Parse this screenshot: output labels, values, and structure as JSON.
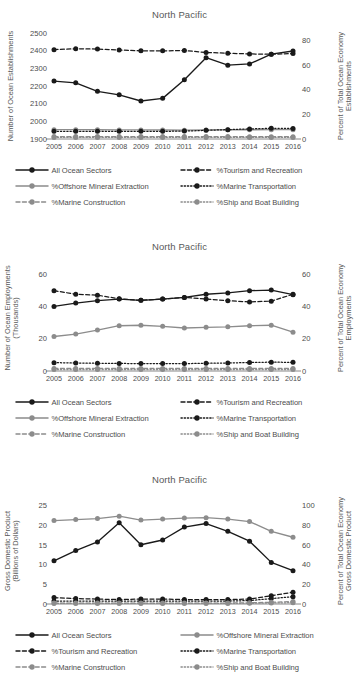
{
  "figure": {
    "background": "#ffffff",
    "colors": {
      "dark": "#1a1a1a",
      "gray": "#8c8c8c",
      "text": "#4c4c4c",
      "axis": "#7a7a7a"
    },
    "years": [
      "2005",
      "2006",
      "2007",
      "2008",
      "2009",
      "2010",
      "2011",
      "2012",
      "2013",
      "2014",
      "2015",
      "2016"
    ]
  },
  "panels": [
    {
      "id": "establishments",
      "title": "North Pacific",
      "left_axis_label": "Number of Ocean Establishments",
      "right_axis_label": "Percent of Total Ocean Economy Establishments",
      "left_ticks": [
        "1900",
        "2000",
        "2100",
        "2200",
        "2300",
        "2400",
        "2500"
      ],
      "right_ticks": [
        "0",
        "20",
        "40",
        "60",
        "80"
      ],
      "legend": [
        {
          "label": "All Ocean Sectors",
          "style": "solid",
          "color": "#1a1a1a"
        },
        {
          "label": "%Tourism and Recreation",
          "style": "dashed",
          "color": "#1a1a1a"
        },
        {
          "label": "%Offshore Mineral Extraction",
          "style": "solid",
          "color": "#8c8c8c"
        },
        {
          "label": "%Marine Transportation",
          "style": "dotted",
          "color": "#1a1a1a"
        },
        {
          "label": "%Marine Construction",
          "style": "dashed",
          "color": "#8c8c8c"
        },
        {
          "label": "%Ship and Boat Building",
          "style": "dotted",
          "color": "#8c8c8c"
        }
      ],
      "chart_data": {
        "type": "line",
        "title": "North Pacific",
        "xlabel": "",
        "ylabel": "Number of Ocean Establishments",
        "y2label": "Percent of Total Ocean Economy Establishments",
        "x": [
          "2005",
          "2006",
          "2007",
          "2008",
          "2009",
          "2010",
          "2011",
          "2012",
          "2013",
          "2014",
          "2015",
          "2016"
        ],
        "ylim": [
          1900,
          2500
        ],
        "y2lim": [
          0,
          86
        ],
        "grid": false,
        "legend_position": "below",
        "series": [
          {
            "name": "All Ocean Sectors",
            "axis": "left",
            "values": [
              2228,
              2218,
              2170,
              2150,
              2115,
              2130,
              2235,
              2360,
              2318,
              2325,
              2380,
              2398
            ]
          },
          {
            "name": "%Tourism and Recreation",
            "axis": "right",
            "values": [
              72.5,
              73.2,
              73.0,
              72.2,
              71.5,
              71.5,
              71.8,
              70.2,
              69.6,
              69.0,
              68.8,
              69.3
            ]
          },
          {
            "name": "%Offshore Mineral Extraction",
            "axis": "right",
            "values": [
              7.6,
              7.6,
              7.5,
              7.4,
              7.4,
              7.3,
              7.2,
              7.4,
              7.5,
              7.5,
              7.6,
              7.6
            ]
          },
          {
            "name": "%Marine Transportation",
            "axis": "right",
            "values": [
              6.2,
              6.2,
              6.2,
              6.2,
              6.2,
              6.2,
              6.4,
              7.0,
              7.6,
              8.2,
              8.7,
              8.6
            ]
          },
          {
            "name": "%Marine Construction",
            "axis": "right",
            "values": [
              2.0,
              2.0,
              2.0,
              2.0,
              2.0,
              2.0,
              2.0,
              2.0,
              2.0,
              1.9,
              1.9,
              1.9
            ]
          },
          {
            "name": "%Ship and Boat Building",
            "axis": "right",
            "values": [
              1.3,
              1.3,
              1.3,
              1.3,
              1.3,
              1.3,
              1.3,
              1.3,
              1.3,
              1.3,
              1.3,
              1.3
            ]
          }
        ]
      }
    },
    {
      "id": "employments",
      "title": "North Pacific",
      "left_axis_label": "Number of Ocean Employments (Thousands)",
      "right_axis_label": "Percent of Total Ocean Economy Employments",
      "left_ticks": [
        "0",
        "20",
        "40",
        "60"
      ],
      "right_ticks": [
        "0",
        "20",
        "40",
        "60"
      ],
      "legend": [
        {
          "label": "All Ocean Sectors",
          "style": "solid",
          "color": "#1a1a1a"
        },
        {
          "label": "%Tourism and Recreation",
          "style": "dashed",
          "color": "#1a1a1a"
        },
        {
          "label": "%Offshore Mineral Extraction",
          "style": "solid",
          "color": "#8c8c8c"
        },
        {
          "label": "%Marine Transportation",
          "style": "dotted",
          "color": "#1a1a1a"
        },
        {
          "label": "%Marine Construction",
          "style": "dashed",
          "color": "#8c8c8c"
        },
        {
          "label": "%Ship and Boat Building",
          "style": "dotted",
          "color": "#8c8c8c"
        }
      ],
      "chart_data": {
        "type": "line",
        "title": "North Pacific",
        "xlabel": "",
        "ylabel": "Number of Ocean Employments (Thousands)",
        "y2label": "Percent of Total Ocean Economy Employments",
        "x": [
          "2005",
          "2006",
          "2007",
          "2008",
          "2009",
          "2010",
          "2011",
          "2012",
          "2013",
          "2014",
          "2015",
          "2016"
        ],
        "ylim": [
          0,
          66
        ],
        "y2lim": [
          0,
          66
        ],
        "grid": false,
        "legend_position": "below",
        "series": [
          {
            "name": "All Ocean Sectors",
            "axis": "left",
            "values": [
              40.2,
              42.3,
              43.8,
              44.8,
              44.0,
              44.8,
              45.8,
              47.8,
              48.6,
              50.0,
              50.4,
              47.5
            ]
          },
          {
            "name": "%Tourism and Recreation",
            "axis": "right",
            "values": [
              50.0,
              47.8,
              47.2,
              45.0,
              44.0,
              44.8,
              45.8,
              44.8,
              43.8,
              43.0,
              43.5,
              47.8
            ]
          },
          {
            "name": "%Offshore Mineral Extraction",
            "axis": "right",
            "values": [
              21.5,
              23.0,
              25.5,
              28.2,
              28.5,
              27.8,
              26.8,
              27.2,
              27.5,
              28.2,
              28.5,
              24.2
            ]
          },
          {
            "name": "%Marine Transportation",
            "axis": "right",
            "values": [
              5.2,
              5.0,
              4.8,
              4.7,
              4.6,
              4.6,
              4.6,
              4.8,
              5.0,
              5.3,
              5.5,
              5.4
            ]
          },
          {
            "name": "%Marine Construction",
            "axis": "right",
            "values": [
              1.6,
              1.6,
              1.6,
              1.6,
              1.6,
              1.6,
              1.6,
              1.6,
              1.6,
              1.6,
              1.6,
              1.6
            ]
          },
          {
            "name": "%Ship and Boat Building",
            "axis": "right",
            "values": [
              0.9,
              0.9,
              0.9,
              0.9,
              0.9,
              0.9,
              0.9,
              0.9,
              0.9,
              0.9,
              0.9,
              0.9
            ]
          }
        ]
      }
    },
    {
      "id": "gdp",
      "title": "North Pacific",
      "left_axis_label": "Gross Domestic Product (Billions of Dollars)",
      "right_axis_label": "Percent of Total Ocean Economy Gross Domestic Product",
      "left_ticks": [
        "0",
        "5",
        "10",
        "15",
        "20",
        "25"
      ],
      "right_ticks": [
        "0",
        "20",
        "40",
        "60",
        "80",
        "100"
      ],
      "legend": [
        {
          "label": "All Ocean Sectors",
          "style": "solid",
          "color": "#1a1a1a"
        },
        {
          "label": "%Offshore Mineral Extraction",
          "style": "solid",
          "color": "#8c8c8c"
        },
        {
          "label": "%Tourism and Recreation",
          "style": "dashed",
          "color": "#1a1a1a"
        },
        {
          "label": "%Marine Transportation",
          "style": "dotted",
          "color": "#1a1a1a"
        },
        {
          "label": "%Marine Construction",
          "style": "dashed",
          "color": "#8c8c8c"
        },
        {
          "label": "%Ship and Boat Building",
          "style": "dotted",
          "color": "#8c8c8c"
        }
      ],
      "chart_data": {
        "type": "line",
        "title": "North Pacific",
        "xlabel": "",
        "ylabel": "Gross Domestic Product (Billions of Dollars)",
        "y2label": "Percent of Total Ocean Economy Gross Domestic Product",
        "x": [
          "2005",
          "2006",
          "2007",
          "2008",
          "2009",
          "2010",
          "2011",
          "2012",
          "2013",
          "2014",
          "2015",
          "2016"
        ],
        "ylim": [
          0,
          27
        ],
        "y2lim": [
          0,
          108
        ],
        "grid": false,
        "legend_position": "below",
        "series": [
          {
            "name": "All Ocean Sectors",
            "axis": "left",
            "values": [
              11.0,
              13.6,
              15.8,
              20.7,
              15.1,
              16.3,
              19.6,
              20.5,
              18.5,
              16.0,
              10.6,
              8.5
            ]
          },
          {
            "name": "%Offshore Mineral Extraction",
            "axis": "right",
            "values": [
              85.0,
              86.0,
              87.0,
              89.5,
              85.5,
              86.5,
              87.5,
              88.0,
              86.5,
              84.0,
              74.0,
              68.0
            ]
          },
          {
            "name": "%Tourism and Recreation",
            "axis": "right",
            "values": [
              6.5,
              5.5,
              5.0,
              4.5,
              5.0,
              5.0,
              4.5,
              4.5,
              4.5,
              5.0,
              8.5,
              12.0
            ]
          },
          {
            "name": "%Marine Transportation",
            "axis": "right",
            "values": [
              3.0,
              3.0,
              3.0,
              3.0,
              3.0,
              3.0,
              3.0,
              3.0,
              3.0,
              3.5,
              5.5,
              7.5
            ]
          },
          {
            "name": "%Marine Construction",
            "axis": "right",
            "values": [
              1.0,
              1.0,
              1.0,
              1.0,
              1.0,
              1.0,
              1.0,
              1.0,
              1.0,
              1.2,
              1.8,
              2.5
            ]
          },
          {
            "name": "%Ship and Boat Building",
            "axis": "right",
            "values": [
              0.6,
              0.6,
              0.6,
              0.6,
              0.6,
              0.6,
              0.6,
              0.6,
              0.6,
              0.7,
              1.0,
              1.4
            ]
          }
        ]
      }
    }
  ]
}
